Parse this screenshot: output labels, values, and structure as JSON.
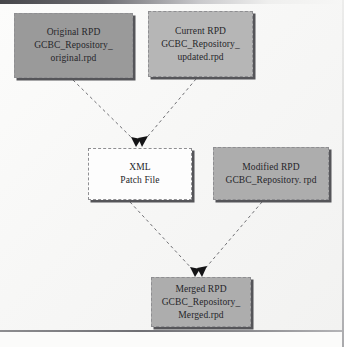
{
  "diagram": {
    "nodes": [
      {
        "id": "original-rpd",
        "name": "node-original-rpd",
        "lines": [
          "Original RPD",
          "GCBC_Repository_",
          "original.rpd"
        ],
        "fill": "#9a9a9a"
      },
      {
        "id": "current-rpd",
        "name": "node-current-rpd",
        "lines": [
          "Current RPD",
          "GCBC_Repository_",
          "updated.rpd"
        ],
        "fill": "#b6b6b6"
      },
      {
        "id": "xml-patch-file",
        "name": "node-xml-patch-file",
        "lines": [
          "XML",
          "Patch File"
        ],
        "fill": "#fdfdfd"
      },
      {
        "id": "modified-rpd",
        "name": "node-modified-rpd",
        "lines": [
          "Modified RPD",
          "GCBC_Repository. rpd"
        ],
        "fill": "#adadad"
      },
      {
        "id": "merged-rpd",
        "name": "node-merged-rpd",
        "lines": [
          "Merged RPD",
          "GCBC_Repository_",
          "Merged.rpd"
        ],
        "fill": "#adadad"
      }
    ],
    "edges": [
      {
        "from": "original-rpd",
        "to": "xml-patch-file",
        "style": "dashed",
        "arrow": "end"
      },
      {
        "from": "current-rpd",
        "to": "xml-patch-file",
        "style": "dashed",
        "arrow": "end"
      },
      {
        "from": "xml-patch-file",
        "to": "merged-rpd",
        "style": "dashed",
        "arrow": "end"
      },
      {
        "from": "modified-rpd",
        "to": "merged-rpd",
        "style": "dashed",
        "arrow": "end"
      }
    ],
    "colors": {
      "edge": "#6f6f73",
      "arrowhead": "#141416",
      "border": "#8e8e91",
      "shadow": "#555559",
      "page": "#f7f7f6"
    }
  }
}
